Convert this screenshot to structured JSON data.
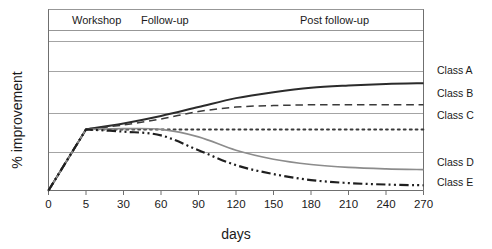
{
  "chart_data": {
    "type": "line",
    "title": "",
    "xlabel": "days",
    "ylabel": "% improvement",
    "x_tick_labels": [
      "0",
      "5",
      "30",
      "60",
      "90",
      "120",
      "150",
      "180",
      "210",
      "240",
      "270"
    ],
    "x_axis_type": "categorical-evenly-spaced",
    "ylim": [
      0,
      100
    ],
    "y_tick_labels": [],
    "grid": "horizontal-only",
    "legend_position": "right-of-plot-inline",
    "phase_bands": [
      {
        "label": "Workshop",
        "start_tick": "0",
        "end_tick": "5"
      },
      {
        "label": "Follow-up",
        "start_tick": "5",
        "end_tick": "90"
      },
      {
        "label": "Post follow-up",
        "start_tick": "90",
        "end_tick": "270"
      }
    ],
    "annotations": [],
    "series": [
      {
        "name": "Class A",
        "label": "Class A",
        "color": "#2b2b2b",
        "style": "solid",
        "width": 2.0,
        "values": [
          0,
          41,
          45,
          50,
          56,
          62,
          66,
          69,
          70.5,
          71.5,
          72
        ]
      },
      {
        "name": "Class B",
        "label": "Class B",
        "color": "#3a3a3a",
        "style": "dashed",
        "width": 1.5,
        "values": [
          0,
          41,
          44,
          48,
          53,
          56,
          57,
          57.5,
          57.5,
          57.5,
          57.5
        ]
      },
      {
        "name": "Class C",
        "label": "Class C",
        "color": "#3a3a3a",
        "style": "dotted",
        "width": 2.0,
        "values": [
          0,
          41,
          41,
          41,
          41,
          41,
          41,
          41,
          41,
          41,
          41
        ]
      },
      {
        "name": "Class D",
        "label": "Class D",
        "color": "#8c8c8c",
        "style": "solid",
        "width": 1.6,
        "values": [
          0,
          41,
          41.5,
          41,
          36,
          27,
          21,
          17.5,
          15.5,
          14.5,
          14
        ]
      },
      {
        "name": "Class E",
        "label": "Class E",
        "color": "#1f1f1f",
        "style": "dashdotdot",
        "width": 2.2,
        "values": [
          0,
          41,
          39.5,
          37,
          27,
          17,
          11,
          7,
          5,
          4,
          3.5
        ]
      }
    ]
  }
}
